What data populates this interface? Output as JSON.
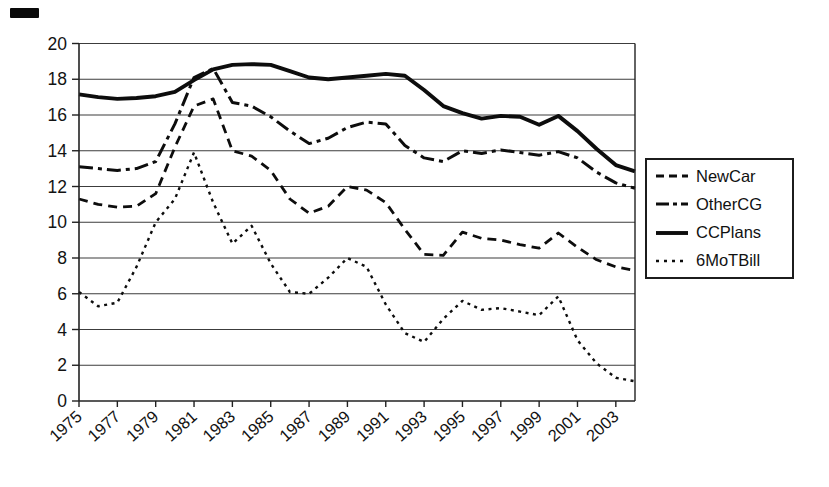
{
  "chart_data": {
    "type": "line",
    "title": "",
    "xlabel": "",
    "ylabel": "",
    "ylim": [
      0,
      20
    ],
    "ytick_step": 2,
    "grid": true,
    "legend_position": "right",
    "line_color": "#0d0d0d",
    "x": [
      1975,
      1976,
      1977,
      1978,
      1979,
      1980,
      1981,
      1982,
      1983,
      1984,
      1985,
      1986,
      1987,
      1988,
      1989,
      1990,
      1991,
      1992,
      1993,
      1994,
      1995,
      1996,
      1997,
      1998,
      1999,
      2000,
      2001,
      2002,
      2003,
      2004
    ],
    "xtick_labels": [
      "1975",
      "1977",
      "1979",
      "1981",
      "1983",
      "1985",
      "1987",
      "1989",
      "1991",
      "1993",
      "1995",
      "1997",
      "1999",
      "2001",
      "2003"
    ],
    "ytick_labels": [
      "0",
      "2",
      "4",
      "6",
      "8",
      "10",
      "12",
      "14",
      "16",
      "18",
      "20"
    ],
    "series": [
      {
        "name": "NewCar",
        "dash": "9 6",
        "width": 2.8,
        "values": [
          11.3,
          11.0,
          10.85,
          10.9,
          11.6,
          14.2,
          16.5,
          16.9,
          14.0,
          13.7,
          12.9,
          11.3,
          10.5,
          10.9,
          12.0,
          11.8,
          11.1,
          9.6,
          8.2,
          8.15,
          9.45,
          9.1,
          9.0,
          8.75,
          8.55,
          9.4,
          8.6,
          7.9,
          7.5,
          7.3
        ]
      },
      {
        "name": "OtherCG",
        "dash": "14 5 4 5",
        "width": 3.0,
        "values": [
          13.1,
          13.0,
          12.9,
          13.0,
          13.4,
          15.5,
          18.1,
          18.6,
          16.7,
          16.5,
          15.9,
          15.1,
          14.4,
          14.7,
          15.3,
          15.6,
          15.5,
          14.3,
          13.6,
          13.4,
          14.0,
          13.85,
          14.05,
          13.9,
          13.75,
          13.95,
          13.6,
          12.8,
          12.2,
          11.9
        ]
      },
      {
        "name": "CCPlans",
        "dash": "",
        "width": 3.9,
        "values": [
          17.15,
          17.0,
          16.9,
          16.95,
          17.05,
          17.3,
          17.95,
          18.55,
          18.8,
          18.85,
          18.8,
          18.45,
          18.1,
          18.0,
          18.1,
          18.2,
          18.3,
          18.2,
          17.4,
          16.5,
          16.1,
          15.8,
          15.95,
          15.9,
          15.45,
          15.95,
          15.1,
          14.1,
          13.2,
          12.85
        ]
      },
      {
        "name": "6MoTBill",
        "dash": "3 4.5",
        "width": 2.4,
        "values": [
          6.1,
          5.3,
          5.5,
          7.5,
          10.0,
          11.3,
          13.9,
          11.1,
          8.8,
          9.8,
          7.7,
          6.1,
          6.0,
          6.9,
          8.0,
          7.5,
          5.4,
          3.8,
          3.3,
          4.6,
          5.6,
          5.1,
          5.2,
          5.0,
          4.8,
          5.85,
          3.4,
          2.1,
          1.3,
          1.1
        ]
      }
    ],
    "legend": [
      "NewCar",
      "OtherCG",
      "CCPlans",
      "6MoTBill"
    ],
    "legend_dashes": [
      "8 5",
      "13 4 4 4",
      "",
      "3 5"
    ],
    "grid_color": "#3c3c3c",
    "frame_color": "#222222"
  }
}
